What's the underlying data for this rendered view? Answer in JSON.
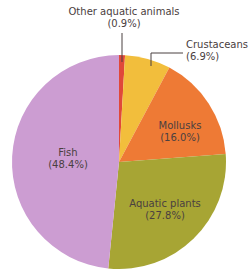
{
  "chart_data": {
    "type": "pie",
    "title": "",
    "categories": [
      "Other aquatic animals",
      "Crustaceans",
      "Mollusks",
      "Aquatic plants",
      "Fish"
    ],
    "values": [
      0.9,
      6.9,
      16.0,
      27.8,
      48.4
    ],
    "value_labels": [
      "(0.9%)",
      "(6.9%)",
      "(16.0%)",
      "(27.8%)",
      "(48.4%)"
    ],
    "colors": [
      "#E0483A",
      "#F2BE3C",
      "#EE7A35",
      "#A7A534",
      "#CC9DD2"
    ],
    "start_angle_deg": 0,
    "direction": "clockwise",
    "legend": "none",
    "label_placement": [
      "outside-leader",
      "outside-leader",
      "inside",
      "inside",
      "inside"
    ]
  },
  "layout": {
    "cx": 119,
    "cy": 162,
    "r": 107
  },
  "labels": [
    {
      "name": "Other aquatic animals",
      "pct": "(0.9%)",
      "x": 124,
      "y": 6,
      "align": "center"
    },
    {
      "name": "Crustaceans",
      "pct": "(6.9%)",
      "x": 186,
      "y": 39,
      "align": "left"
    },
    {
      "name": "Mollusks",
      "pct": "(16.0%)",
      "x": 180,
      "y": 120,
      "align": "center"
    },
    {
      "name": "Aquatic plants",
      "pct": "(27.8%)",
      "x": 165,
      "y": 198,
      "align": "center"
    },
    {
      "name": "Fish",
      "pct": "(48.4%)",
      "x": 68,
      "y": 147,
      "align": "center"
    }
  ],
  "leaders": [
    {
      "points": [
        [
          122,
          33
        ],
        [
          122,
          62
        ]
      ]
    },
    {
      "points": [
        [
          183,
          53
        ],
        [
          151,
          53
        ],
        [
          151,
          66
        ]
      ]
    }
  ],
  "leader_color": "#4a4040"
}
